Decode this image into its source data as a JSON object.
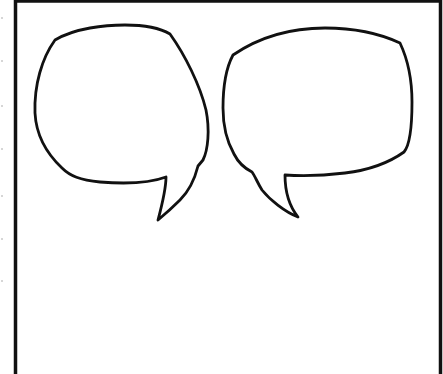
{
  "panel": {
    "type": "blank-comic-panel",
    "background_color": "#ffffff",
    "stroke_color": "#111111",
    "frame": {
      "left": 15.5,
      "top": 1,
      "right": 440.5,
      "stroke_width": 3.5
    }
  },
  "bubbles": [
    {
      "id": "left",
      "shape": "speech-bubble",
      "tail_direction": "down-left",
      "text": ""
    },
    {
      "id": "right",
      "shape": "speech-bubble",
      "tail_direction": "down-right",
      "text": ""
    }
  ],
  "margin_dots_y": [
    17,
    60,
    105,
    148,
    195,
    238,
    280
  ]
}
